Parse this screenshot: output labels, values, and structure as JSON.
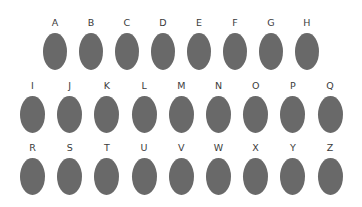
{
  "figure": {
    "background_color": "#ffffff",
    "shape_fill_color": "#696969",
    "label_color": "#3b3b3b",
    "width": 362,
    "height": 207
  },
  "chart_data": {
    "type": "table",
    "title": "",
    "subtitle": "",
    "xlabel": "",
    "ylabel": "",
    "grid": false,
    "legend": "none",
    "marker": {
      "shape": "ellipse",
      "fill": "#696969",
      "edge": "none"
    },
    "rows": [
      {
        "index": 1,
        "count": 8,
        "labels": [
          "A",
          "B",
          "C",
          "D",
          "E",
          "F",
          "G",
          "H"
        ],
        "values": [
          1,
          1,
          1,
          1,
          1,
          1,
          1,
          1
        ]
      },
      {
        "index": 2,
        "count": 9,
        "labels": [
          "I",
          "J",
          "K",
          "L",
          "M",
          "N",
          "O",
          "P",
          "Q"
        ],
        "values": [
          1,
          1,
          1,
          1,
          1,
          1,
          1,
          1,
          1
        ]
      },
      {
        "index": 3,
        "count": 9,
        "labels": [
          "R",
          "S",
          "T",
          "U",
          "V",
          "W",
          "X",
          "Y",
          "Z"
        ],
        "values": [
          1,
          1,
          1,
          1,
          1,
          1,
          1,
          1,
          1
        ]
      }
    ],
    "categories": [
      "A",
      "B",
      "C",
      "D",
      "E",
      "F",
      "G",
      "H",
      "I",
      "J",
      "K",
      "L",
      "M",
      "N",
      "O",
      "P",
      "Q",
      "R",
      "S",
      "T",
      "U",
      "V",
      "W",
      "X",
      "Y",
      "Z"
    ],
    "values": [
      1,
      1,
      1,
      1,
      1,
      1,
      1,
      1,
      1,
      1,
      1,
      1,
      1,
      1,
      1,
      1,
      1,
      1,
      1,
      1,
      1,
      1,
      1,
      1,
      1,
      1
    ],
    "total_items": 26
  }
}
